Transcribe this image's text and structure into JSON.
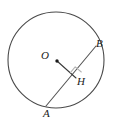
{
  "figure": {
    "kind": "circle-geometry-diagram",
    "background_color": "#ffffff",
    "stroke_color": "#4a4a4a",
    "chord_color": "#555555",
    "radius_color": "#3a3a3a",
    "right_angle_color": "#b0b0b0",
    "label_color": "#1a1a1a",
    "circle": {
      "center_x": 56,
      "center_y": 60,
      "radius": 48,
      "stroke_width": 1.1
    },
    "center_dot": {
      "cx": 57,
      "cy": 61,
      "r": 1.7
    },
    "chord": {
      "name": "AB",
      "x1": 46,
      "y1": 106,
      "x2": 96,
      "y2": 46,
      "stroke_width": 1.1
    },
    "perpendicular": {
      "name": "OH",
      "x1": 57,
      "y1": 61,
      "x2": 76,
      "y2": 78,
      "stroke_width": 1.1
    },
    "right_angle_marker": {
      "at": "H",
      "size": 8,
      "stroke_width": 1.0,
      "points": "76,78 70,72 76,66 82,72"
    },
    "labels": {
      "center": "O",
      "chord_end_top": "B",
      "foot_of_perpendicular": "H",
      "chord_end_bottom": "A"
    }
  }
}
